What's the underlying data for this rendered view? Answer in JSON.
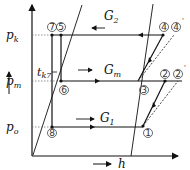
{
  "diagram": {
    "type": "p-h diagram (two-stage refrigeration cycle)",
    "axes": {
      "x_label": "h",
      "y_labels": {
        "pk": {
          "main": "p",
          "sub": "k"
        },
        "pm": {
          "main": "p",
          "sub": "m"
        },
        "po": {
          "main": "p",
          "sub": "o"
        }
      }
    },
    "annotations": {
      "tk7": {
        "main": "t",
        "sub": "k7"
      },
      "G2": {
        "main": "G",
        "sub": "2"
      },
      "Gm": {
        "main": "G",
        "sub": "m"
      },
      "G1": {
        "main": "G",
        "sub": "1"
      }
    },
    "points": {
      "p1": "1",
      "p2": "2",
      "p2prime": "2",
      "p3": "3",
      "p4": "4",
      "p4prime": "4",
      "p5": "5",
      "p6": "6",
      "p7": "7",
      "p8": "8"
    },
    "prime_mark": "'",
    "colors": {
      "line": "#111111",
      "dashed": "#333333",
      "grid_dotted": "#666666"
    }
  }
}
